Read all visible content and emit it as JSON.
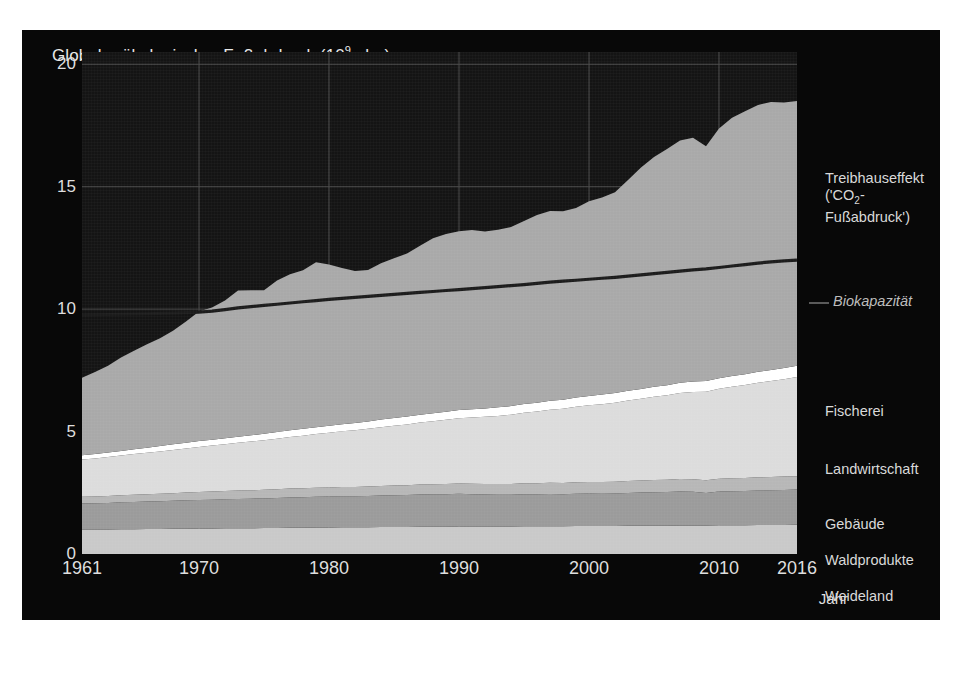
{
  "figure": {
    "background": "#080808",
    "plot_background": "#141414"
  },
  "axis": {
    "title_main": "Globaler ökologischer Fußabdruck (10",
    "title_sup": "9",
    "title_tail": " gha)",
    "xlabel": "Jahr",
    "yticks": [
      "0",
      "5",
      "10",
      "15",
      "20"
    ],
    "xticks": [
      "1961",
      "1970",
      "1980",
      "1990",
      "2000",
      "2010",
      "2016"
    ]
  },
  "legend": {
    "greenhouse_line1": "Treibhauseffekt",
    "greenhouse_line2a": "('CO",
    "greenhouse_sub": "2",
    "greenhouse_line2b": "-",
    "greenhouse_line3": "Fußabdruck')",
    "biocapacity": "Biokapazität",
    "fishing": "Fischerei",
    "cropland": "Landwirtschaft",
    "builtup": "Gebäude",
    "forest": "Waldprodukte",
    "grazing": "Weideland"
  },
  "colors": {
    "greenhouse": "#a9a9a9",
    "fishing": "#ffffff",
    "cropland": "#dcdcdc",
    "builtup": "#b7b7b7",
    "forest": "#9b9b9b",
    "grazing": "#c9c9c9",
    "biocapacity_line": "#1c1c1c",
    "grid": "#4a4a4a",
    "text": "#dedede"
  },
  "chart_data": {
    "type": "area",
    "subtitle": "",
    "xlabel": "Jahr",
    "ylabel": "Globaler ökologischer Fußabdruck (10^9 gha)",
    "xlim": [
      1961,
      2016
    ],
    "ylim": [
      0,
      20.5
    ],
    "yticks": [
      0,
      5,
      10,
      15,
      20
    ],
    "xticks": [
      1961,
      1970,
      1980,
      1990,
      2000,
      2010,
      2016
    ],
    "grid": true,
    "stacked": true,
    "legend_position": "right",
    "x": [
      1961,
      1962,
      1963,
      1964,
      1965,
      1966,
      1967,
      1968,
      1969,
      1970,
      1971,
      1972,
      1973,
      1974,
      1975,
      1976,
      1977,
      1978,
      1979,
      1980,
      1981,
      1982,
      1983,
      1984,
      1985,
      1986,
      1987,
      1988,
      1989,
      1990,
      1991,
      1992,
      1993,
      1994,
      1995,
      1996,
      1997,
      1998,
      1999,
      2000,
      2001,
      2002,
      2003,
      2004,
      2005,
      2006,
      2007,
      2008,
      2009,
      2010,
      2011,
      2012,
      2013,
      2014,
      2015,
      2016
    ],
    "series": [
      {
        "name": "Weideland",
        "color": "#c9c9c9",
        "values": [
          1.0,
          1.0,
          1.0,
          1.01,
          1.01,
          1.02,
          1.02,
          1.03,
          1.03,
          1.04,
          1.04,
          1.05,
          1.05,
          1.05,
          1.06,
          1.06,
          1.07,
          1.07,
          1.08,
          1.08,
          1.09,
          1.09,
          1.09,
          1.1,
          1.1,
          1.1,
          1.11,
          1.11,
          1.11,
          1.12,
          1.12,
          1.12,
          1.12,
          1.12,
          1.13,
          1.13,
          1.13,
          1.13,
          1.14,
          1.14,
          1.14,
          1.14,
          1.15,
          1.15,
          1.15,
          1.15,
          1.16,
          1.16,
          1.16,
          1.17,
          1.17,
          1.17,
          1.18,
          1.18,
          1.18,
          1.19
        ]
      },
      {
        "name": "Waldprodukte",
        "color": "#9b9b9b",
        "values": [
          1.06,
          1.07,
          1.08,
          1.1,
          1.11,
          1.12,
          1.13,
          1.14,
          1.16,
          1.17,
          1.18,
          1.19,
          1.2,
          1.21,
          1.21,
          1.23,
          1.24,
          1.25,
          1.26,
          1.27,
          1.27,
          1.27,
          1.28,
          1.29,
          1.3,
          1.31,
          1.32,
          1.33,
          1.33,
          1.34,
          1.32,
          1.31,
          1.3,
          1.3,
          1.31,
          1.31,
          1.32,
          1.31,
          1.32,
          1.33,
          1.32,
          1.33,
          1.34,
          1.36,
          1.37,
          1.38,
          1.39,
          1.38,
          1.33,
          1.38,
          1.39,
          1.4,
          1.41,
          1.42,
          1.43,
          1.44
        ]
      },
      {
        "name": "Gebäude",
        "color": "#b7b7b7",
        "values": [
          0.28,
          0.28,
          0.29,
          0.29,
          0.3,
          0.3,
          0.31,
          0.31,
          0.32,
          0.32,
          0.33,
          0.33,
          0.34,
          0.34,
          0.35,
          0.35,
          0.36,
          0.36,
          0.37,
          0.37,
          0.38,
          0.38,
          0.39,
          0.39,
          0.4,
          0.4,
          0.41,
          0.41,
          0.42,
          0.42,
          0.43,
          0.43,
          0.44,
          0.44,
          0.45,
          0.45,
          0.46,
          0.46,
          0.47,
          0.47,
          0.48,
          0.48,
          0.49,
          0.49,
          0.5,
          0.5,
          0.51,
          0.51,
          0.52,
          0.52,
          0.53,
          0.53,
          0.54,
          0.54,
          0.55,
          0.55
        ]
      },
      {
        "name": "Landwirtschaft",
        "color": "#dcdcdc",
        "values": [
          1.52,
          1.55,
          1.59,
          1.62,
          1.66,
          1.69,
          1.73,
          1.77,
          1.8,
          1.84,
          1.88,
          1.91,
          1.95,
          1.99,
          2.03,
          2.07,
          2.11,
          2.15,
          2.19,
          2.23,
          2.27,
          2.31,
          2.35,
          2.4,
          2.44,
          2.48,
          2.53,
          2.57,
          2.62,
          2.66,
          2.7,
          2.74,
          2.78,
          2.83,
          2.88,
          2.93,
          2.98,
          3.03,
          3.08,
          3.13,
          3.18,
          3.23,
          3.29,
          3.34,
          3.4,
          3.45,
          3.51,
          3.57,
          3.62,
          3.68,
          3.74,
          3.8,
          3.86,
          3.92,
          3.98,
          4.05
        ]
      },
      {
        "name": "Fischerei",
        "color": "#ffffff",
        "values": [
          0.17,
          0.18,
          0.18,
          0.19,
          0.2,
          0.21,
          0.22,
          0.23,
          0.23,
          0.24,
          0.24,
          0.25,
          0.25,
          0.26,
          0.26,
          0.27,
          0.27,
          0.28,
          0.28,
          0.29,
          0.29,
          0.3,
          0.3,
          0.31,
          0.31,
          0.32,
          0.32,
          0.33,
          0.33,
          0.34,
          0.34,
          0.34,
          0.35,
          0.35,
          0.36,
          0.36,
          0.37,
          0.37,
          0.38,
          0.38,
          0.39,
          0.39,
          0.4,
          0.4,
          0.41,
          0.41,
          0.42,
          0.42,
          0.43,
          0.43,
          0.44,
          0.44,
          0.45,
          0.45,
          0.46,
          0.46
        ]
      },
      {
        "name": "Treibhauseffekt ('CO2-Fußabdruck')",
        "color": "#a9a9a9",
        "values": [
          3.17,
          3.35,
          3.55,
          3.81,
          4.02,
          4.23,
          4.4,
          4.64,
          4.95,
          5.29,
          5.4,
          5.62,
          5.97,
          5.92,
          5.86,
          6.19,
          6.37,
          6.48,
          6.73,
          6.58,
          6.38,
          6.21,
          6.19,
          6.38,
          6.53,
          6.66,
          6.9,
          7.14,
          7.26,
          7.3,
          7.32,
          7.23,
          7.25,
          7.31,
          7.47,
          7.66,
          7.75,
          7.7,
          7.74,
          7.96,
          8.05,
          8.2,
          8.6,
          9.04,
          9.38,
          9.65,
          9.9,
          9.96,
          9.59,
          10.2,
          10.55,
          10.74,
          10.9,
          10.95,
          10.84,
          10.81
        ]
      }
    ],
    "reference_line": {
      "name": "Biokapazität",
      "color": "#1c1c1c",
      "values": [
        9.76,
        9.77,
        9.78,
        9.79,
        9.8,
        9.81,
        9.83,
        9.84,
        9.86,
        9.88,
        9.92,
        9.98,
        10.05,
        10.1,
        10.15,
        10.2,
        10.25,
        10.3,
        10.35,
        10.4,
        10.44,
        10.48,
        10.52,
        10.56,
        10.6,
        10.64,
        10.68,
        10.72,
        10.76,
        10.8,
        10.84,
        10.88,
        10.92,
        10.96,
        11.0,
        11.05,
        11.1,
        11.14,
        11.18,
        11.22,
        11.26,
        11.3,
        11.35,
        11.4,
        11.45,
        11.5,
        11.55,
        11.6,
        11.64,
        11.7,
        11.76,
        11.82,
        11.88,
        11.93,
        11.97,
        12.0
      ]
    }
  }
}
